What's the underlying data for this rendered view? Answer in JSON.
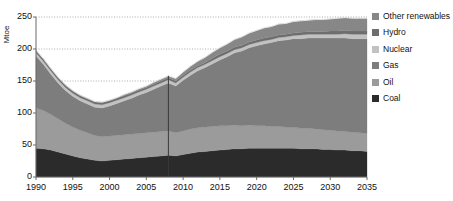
{
  "axes": {
    "ylabel": "Mtoe",
    "yticks": [
      0,
      50,
      100,
      150,
      200,
      250
    ],
    "xticks": [
      1990,
      1995,
      2000,
      2005,
      2010,
      2015,
      2020,
      2025,
      2030,
      2035
    ]
  },
  "legend": {
    "items": [
      {
        "label": "Other renewables",
        "color": "#878787"
      },
      {
        "label": "Hydro",
        "color": "#6e6e6e"
      },
      {
        "label": "Nuclear",
        "color": "#c2c2c2"
      },
      {
        "label": "Gas",
        "color": "#7d7d7d"
      },
      {
        "label": "Oil",
        "color": "#9b9b9b"
      },
      {
        "label": "Coal",
        "color": "#2b2b2b"
      }
    ]
  },
  "divider": {
    "year": 2008,
    "color": "#3a3a3a"
  },
  "chart_data": {
    "type": "area",
    "title": "",
    "xlabel": "",
    "ylabel": "Mtoe",
    "xlim": [
      1990,
      2035
    ],
    "ylim": [
      0,
      250
    ],
    "grid": true,
    "legend_position": "right",
    "stacked": true,
    "x": [
      1990,
      1991,
      1992,
      1993,
      1994,
      1995,
      1996,
      1997,
      1998,
      1999,
      2000,
      2001,
      2002,
      2003,
      2004,
      2005,
      2006,
      2007,
      2008,
      2009,
      2010,
      2011,
      2012,
      2013,
      2014,
      2015,
      2016,
      2017,
      2018,
      2019,
      2020,
      2021,
      2022,
      2023,
      2024,
      2025,
      2026,
      2027,
      2028,
      2029,
      2030,
      2031,
      2032,
      2033,
      2034,
      2035
    ],
    "series": [
      {
        "name": "Coal",
        "color": "#2b2b2b",
        "values": [
          45,
          44,
          42,
          39,
          36,
          33,
          30,
          28,
          26,
          25,
          26,
          27,
          28,
          29,
          30,
          31,
          32,
          33,
          34,
          33,
          35,
          37,
          39,
          40,
          41,
          42,
          43,
          44,
          44,
          45,
          45,
          45,
          45,
          45,
          45,
          45,
          44,
          44,
          44,
          43,
          43,
          42,
          42,
          41,
          41,
          40
        ]
      },
      {
        "name": "Oil",
        "color": "#9b9b9b",
        "values": [
          63,
          60,
          56,
          52,
          48,
          45,
          43,
          41,
          39,
          38,
          38,
          38,
          38,
          38,
          38,
          38,
          38,
          38,
          38,
          36,
          37,
          38,
          38,
          38,
          38,
          38,
          37,
          37,
          36,
          36,
          35,
          35,
          34,
          34,
          33,
          33,
          32,
          32,
          31,
          31,
          30,
          30,
          29,
          29,
          28,
          28
        ]
      },
      {
        "name": "Gas",
        "color": "#7d7d7d",
        "values": [
          81,
          72,
          63,
          56,
          51,
          48,
          46,
          45,
          44,
          45,
          47,
          50,
          53,
          56,
          60,
          63,
          67,
          71,
          75,
          73,
          79,
          84,
          89,
          93,
          98,
          103,
          108,
          113,
          117,
          121,
          125,
          128,
          131,
          134,
          136,
          138,
          140,
          141,
          142,
          143,
          144,
          145,
          146,
          146,
          147,
          148
        ]
      },
      {
        "name": "Nuclear",
        "color": "#c2c2c2",
        "values": [
          5,
          5,
          5,
          5,
          5,
          5,
          5,
          5,
          5,
          5,
          5,
          5,
          5,
          5,
          5,
          5,
          5,
          5,
          5,
          5,
          5,
          5,
          5,
          5,
          5,
          5,
          5,
          5,
          5,
          5,
          5,
          5,
          5,
          5,
          5,
          5,
          6,
          6,
          6,
          6,
          6,
          6,
          7,
          7,
          7,
          7
        ]
      },
      {
        "name": "Hydro",
        "color": "#6e6e6e",
        "values": [
          3,
          3,
          3,
          3,
          3,
          3,
          3,
          3,
          3,
          3,
          3,
          3,
          3,
          3,
          3,
          3,
          3,
          3,
          3,
          3,
          3,
          3,
          3,
          3,
          4,
          4,
          4,
          4,
          4,
          4,
          4,
          4,
          4,
          4,
          4,
          4,
          4,
          4,
          4,
          4,
          5,
          5,
          5,
          5,
          5,
          5
        ]
      },
      {
        "name": "Other renewables",
        "color": "#878787",
        "values": [
          1,
          1,
          1,
          1,
          1,
          1,
          1,
          1,
          1,
          1,
          1,
          1,
          2,
          2,
          2,
          2,
          3,
          3,
          3,
          4,
          5,
          6,
          7,
          8,
          9,
          10,
          11,
          12,
          13,
          14,
          15,
          16,
          16,
          17,
          17,
          18,
          18,
          18,
          19,
          19,
          19,
          20,
          20,
          20,
          20,
          20
        ]
      }
    ],
    "totals": [
      198,
      185,
      170,
      156,
      144,
      135,
      128,
      123,
      118,
      117,
      120,
      124,
      129,
      133,
      138,
      142,
      148,
      153,
      158,
      154,
      164,
      173,
      181,
      187,
      195,
      202,
      208,
      215,
      219,
      225,
      229,
      233,
      235,
      239,
      240,
      243,
      244,
      245,
      246,
      246,
      247,
      248,
      249,
      248,
      248,
      248
    ]
  }
}
